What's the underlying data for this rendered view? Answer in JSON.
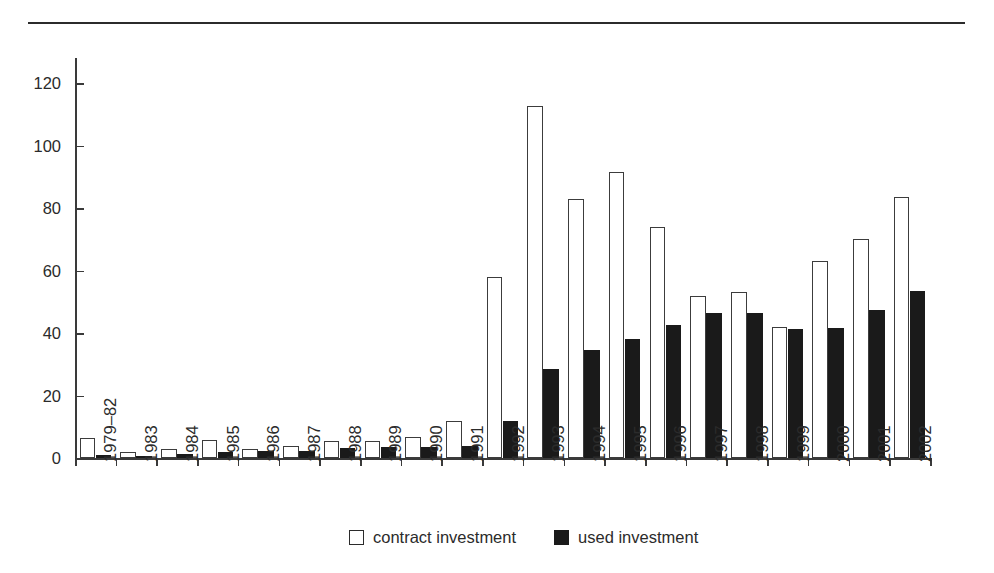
{
  "chart_data": {
    "type": "bar",
    "title": "",
    "xlabel": "",
    "ylabel": "",
    "ylim": [
      0,
      128
    ],
    "yticks": [
      0,
      20,
      40,
      60,
      80,
      100,
      120
    ],
    "grid": false,
    "legend_position": "bottom-center",
    "categories": [
      "1979–82",
      "1983",
      "1984",
      "1985",
      "1986",
      "1987",
      "1988",
      "1989",
      "1990",
      "1991",
      "1992",
      "1993",
      "1994",
      "1995",
      "1996",
      "1997",
      "1998",
      "1999",
      "2000",
      "2001",
      "2002"
    ],
    "series": [
      {
        "name": "contract investment",
        "fill": "#ffffff",
        "stroke": "#3c3c3c",
        "values": [
          6.5,
          2.0,
          3.0,
          5.9,
          2.9,
          3.7,
          5.3,
          5.6,
          6.6,
          12.0,
          58.0,
          112.5,
          83.0,
          91.5,
          73.8,
          52.0,
          53.0,
          42.0,
          63.0,
          70.0,
          83.5
        ]
      },
      {
        "name": "used investment",
        "fill": "#1a1a1a",
        "stroke": "#1a1a1a",
        "values": [
          1.0,
          0.6,
          1.3,
          2.0,
          2.2,
          2.3,
          3.2,
          3.4,
          3.5,
          4.0,
          11.8,
          28.5,
          34.5,
          38.0,
          42.5,
          46.3,
          46.3,
          41.2,
          41.5,
          47.5,
          53.5
        ]
      }
    ]
  },
  "axis": {
    "y_tick_labels": [
      "0",
      "20",
      "40",
      "60",
      "80",
      "100",
      "120"
    ]
  },
  "legend": {
    "items": [
      {
        "label": "contract investment",
        "swatch": "open-square"
      },
      {
        "label": "used investment",
        "swatch": "filled-square"
      }
    ]
  },
  "colors": {
    "bar_contract_fill": "#ffffff",
    "bar_contract_stroke": "#3c3c3c",
    "bar_used_fill": "#1a1a1a",
    "axis": "#3a3a3a",
    "text": "#2b2b2b",
    "rule": "#2b2b2b",
    "background": "#ffffff"
  }
}
